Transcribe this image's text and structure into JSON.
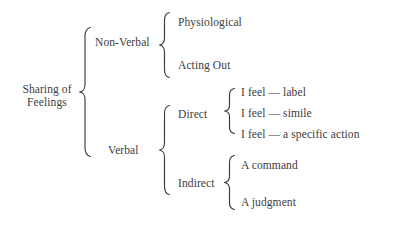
{
  "diagram": {
    "type": "bracket-tree",
    "ink_color": "#3c3c3c",
    "background_color": "#ffffff",
    "root": {
      "label_line1": "Sharing of",
      "label_line2": "Feelings"
    },
    "branches": {
      "non_verbal": {
        "label": "Non-Verbal",
        "children": [
          {
            "label": "Physiological"
          },
          {
            "label": "Acting Out"
          }
        ]
      },
      "verbal": {
        "label": "Verbal",
        "children": [
          {
            "label": "Direct",
            "children": [
              {
                "label": "I feel — label"
              },
              {
                "label": "I feel — simile"
              },
              {
                "label": "I feel — a specific action"
              }
            ]
          },
          {
            "label": "Indirect",
            "children": [
              {
                "label": "A command"
              },
              {
                "label": "A judgment"
              }
            ]
          }
        ]
      }
    }
  }
}
